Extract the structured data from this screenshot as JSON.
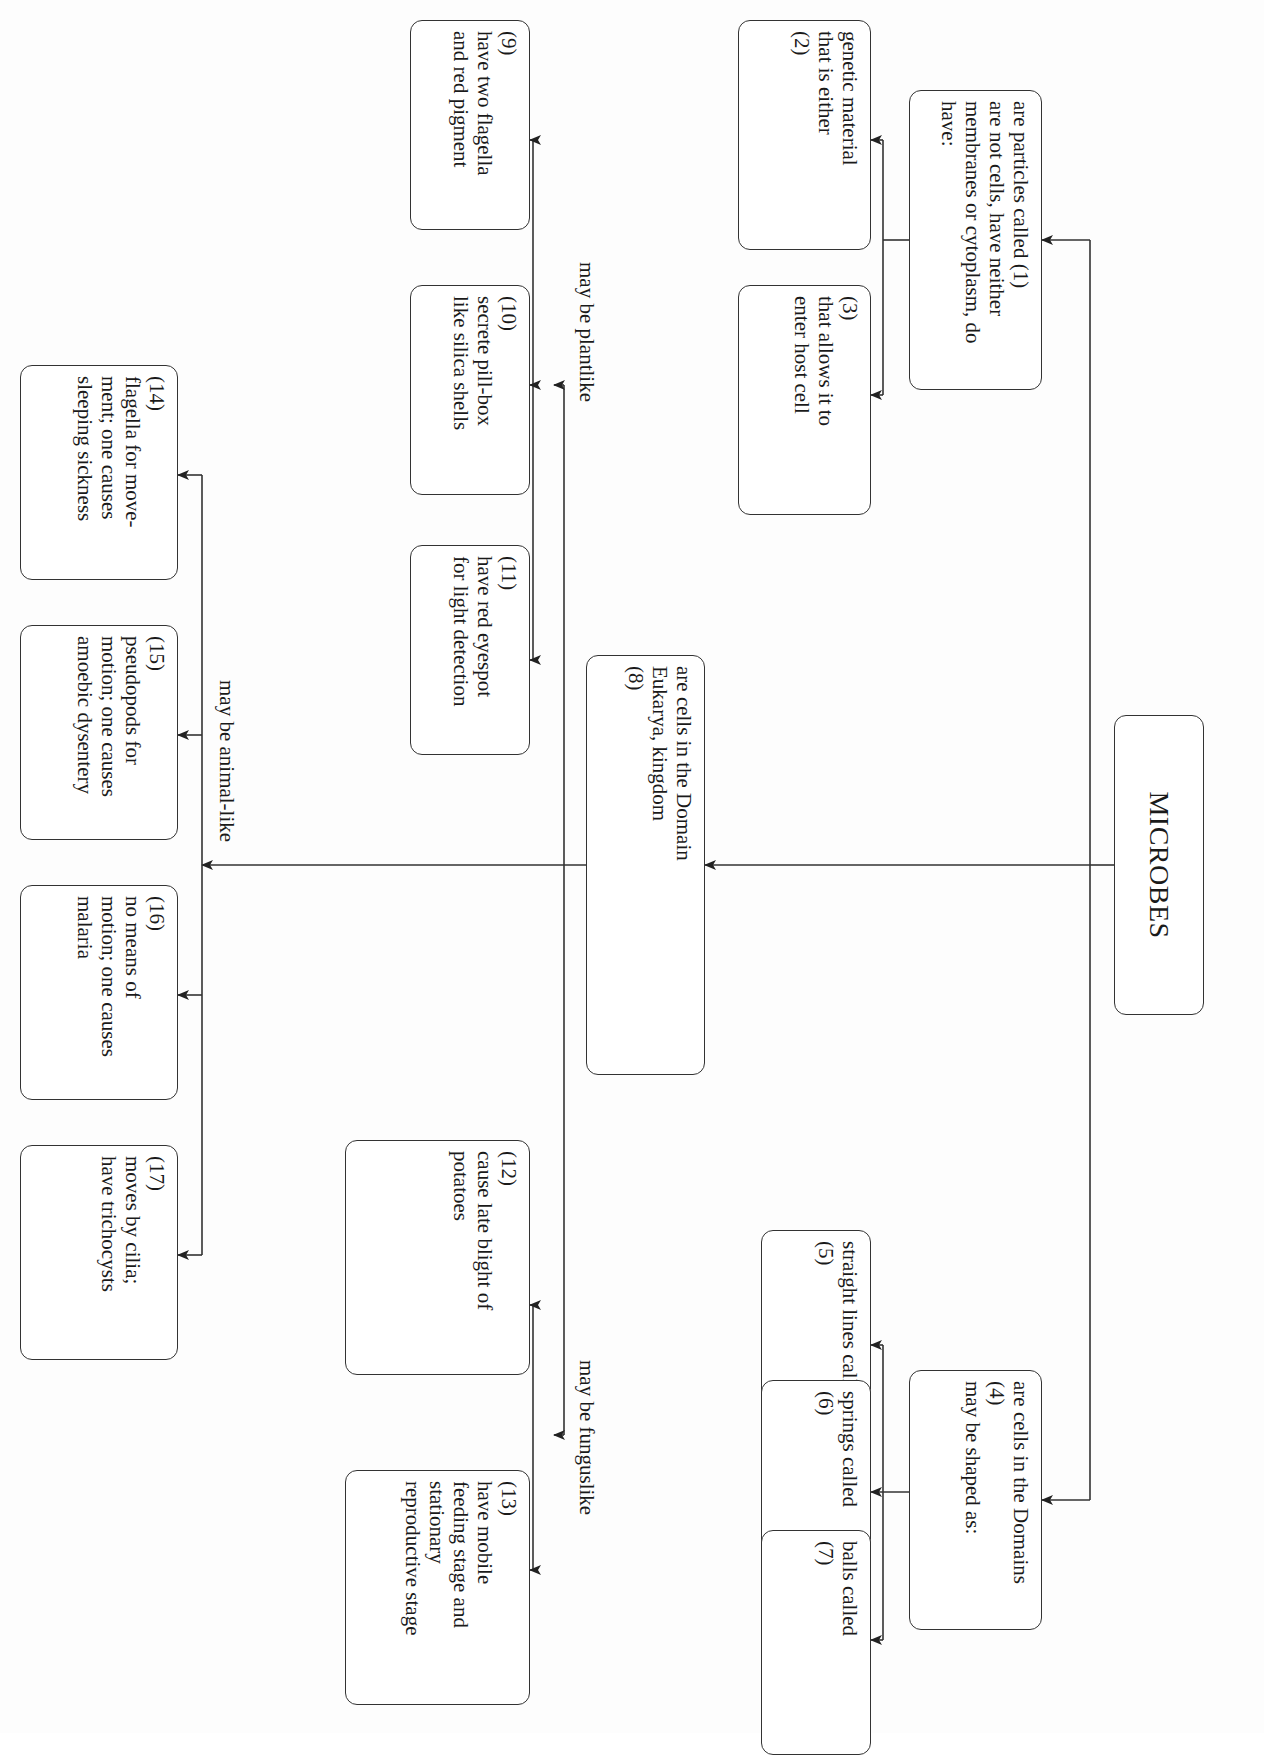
{
  "diagram": {
    "title": "MICROBES",
    "orientation": "rotated 90° clockwise (text reads top-to-bottom)",
    "stroke_color": "#333333",
    "nodes": {
      "viruses": "are particles called (1)\nare not cells, have neither\nmembranes or cytoplasm, do have:",
      "n2": "genetic material\nthat is either\n(2)",
      "n3": "(3)\nthat allows it to\nenter host cell",
      "eukarya": "are cells in the Domain\nEukarya, kingdom\n(8)",
      "n9": "(9)\nhave two flagella\nand red pigment",
      "n10": "(10)\nsecrete pill-box\nlike silica shells",
      "n11": "(11)\nhave red eyespot\nfor light detection",
      "n14": "(14)\nflagella for move-\nment; one causes\nsleeping sickness",
      "n15": "(15)\npseudopods for\nmotion; one causes\namoebic dysentery",
      "n16": "(16)\nno means of\nmotion; one causes\nmalaria",
      "n17": "(17)\nmoves by cilia;\nhave trichocysts",
      "n12": "(12)\ncause late blight of\npotatoes",
      "n13": "(13)\nhave mobile\nfeeding stage and\nstationary\nreproductive stage",
      "domains": "are cells in the Domains\n(4)\nmay be shaped as:",
      "n5": "straight lines called\n(5)",
      "n6": "springs called\n(6)",
      "n7": "balls called\n(7)"
    },
    "branch_labels": {
      "plantlike": "may be plantlike",
      "animallike": "may be animal-like",
      "funguslike": "may be funguslike"
    }
  }
}
